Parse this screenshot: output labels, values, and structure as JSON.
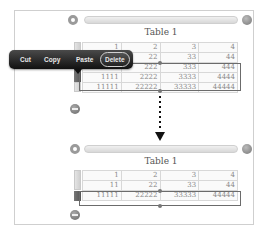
{
  "before": {
    "title": "Table 1",
    "rows": [
      [
        "1",
        "2",
        "3",
        "4"
      ],
      [
        "11",
        "22",
        "33",
        "44"
      ],
      [
        "111",
        "222",
        "333",
        "444"
      ],
      [
        "1111",
        "2222",
        "3333",
        "4444"
      ],
      [
        "11111",
        "22222",
        "33333",
        "44444"
      ]
    ],
    "selected_rows": [
      2,
      3
    ]
  },
  "context_menu": {
    "items": [
      {
        "label": "Cut"
      },
      {
        "label": "Copy"
      },
      {
        "label": "Paste"
      },
      {
        "label": "Delete",
        "highlighted": true
      }
    ]
  },
  "after": {
    "title": "Table 1",
    "rows": [
      [
        "1",
        "2",
        "3",
        "4"
      ],
      [
        "11",
        "22",
        "33",
        "44"
      ],
      [
        "11111",
        "22222",
        "33333",
        "44444"
      ]
    ],
    "selected_rows": [
      2
    ]
  },
  "colors": {
    "menu_bg": "#222222",
    "selection_border": "#6b6b6b",
    "cell_text": "#888888"
  }
}
